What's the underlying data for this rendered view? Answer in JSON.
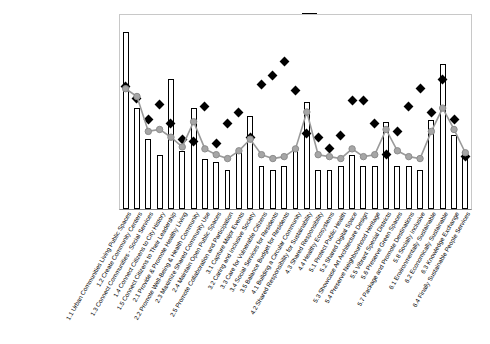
{
  "legend": {
    "items": [
      {
        "label": "Strategic Gap",
        "mark": "bar-swatch-icon"
      },
      {
        "label": "Risk",
        "mark": "diamond-marker-icon"
      },
      {
        "label": "Impact of Initiatives",
        "mark": "line-marker-icon"
      }
    ]
  },
  "colors": {
    "bar_fill": "#ffffff",
    "bar_stroke": "#000000",
    "risk_marker": "#000000",
    "impact_line": "#9a9a9a",
    "plot_border": "#c8c8c8"
  },
  "chart_data": {
    "type": "bar",
    "title": "",
    "xlabel": "",
    "ylabel": "",
    "ylim": [
      0,
      100
    ],
    "grid": false,
    "legend_position": "top-right",
    "categories": [
      "1.1 Urban Communities Living Public Spaces",
      "1.2 Create Community Centers",
      "1.3 Connect Communities - Social Services",
      "1.4 Connect Citizens to City History",
      "1.5 Connect Citizens to Their Leadership",
      "2.1 Provide & Promote Healthy Living",
      "2.2 Promote Well-Being & Health Community",
      "2.3 Maximize Shared Community Use",
      "2.4 Maintain Open Public Spaces",
      "2.5 Promote Collaboration and Participation",
      "3.1 Capture Major Events",
      "3.2 Caring and Inclusive Society",
      "3.3 Care for Vulnerable Citizens",
      "3.4 Social Services for Residents",
      "3.5 Balance Budget for Residents",
      "4.1 Building a Circular Community",
      "4.2 Shared Responsibility for Sustainability",
      "4.3 Shared Responsibility",
      "4.4 Healthy Ecosystems",
      "5.1 Protect Public Health",
      "5.2 Shared Digital Space",
      "5.3 Showcase Art Architecture Design",
      "5.4 Preserve Neighbourhood Heritage",
      "5.5 Vibrant Special Districts",
      "5.6 Preserve Green Spaces",
      "5.7 Package and Promote Destinations",
      "5.8 Socially Inclusive",
      "6.1 Environmentally Sustainable",
      "6.2 Economically Sustainable",
      "6.3 Knowledge Exchange",
      "6.4 Finally Sustainable People Services"
    ],
    "series": [
      {
        "name": "Strategic Gap",
        "type": "bar",
        "values": [
          91,
          52,
          36,
          28,
          67,
          30,
          52,
          26,
          24,
          20,
          30,
          48,
          22,
          20,
          22,
          32,
          55,
          20,
          20,
          22,
          28,
          22,
          22,
          45,
          22,
          22,
          20,
          46,
          75,
          38,
          30
        ]
      },
      {
        "name": "Risk",
        "type": "scatter",
        "values": [
          63,
          57,
          46,
          54,
          44,
          36,
          35,
          53,
          34,
          44,
          50,
          37,
          64,
          69,
          76,
          61,
          39,
          37,
          31,
          38,
          56,
          56,
          44,
          28,
          40,
          53,
          62,
          50,
          67,
          46,
          27
        ]
      },
      {
        "name": "Impact of Initiatives",
        "type": "line",
        "values": [
          62,
          58,
          40,
          41,
          37,
          32,
          45,
          31,
          28,
          26,
          30,
          36,
          28,
          26,
          27,
          31,
          50,
          28,
          27,
          26,
          31,
          27,
          28,
          41,
          30,
          27,
          26,
          40,
          52,
          41,
          29
        ]
      }
    ]
  }
}
